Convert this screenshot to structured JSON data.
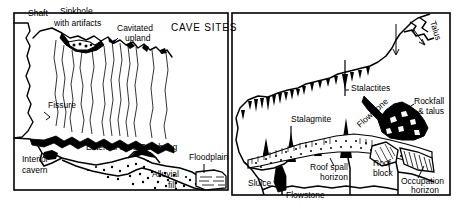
{
  "figure": {
    "title": "CAVE SITES",
    "type": "two-panel geological cross-section line drawing",
    "colors": {
      "ink": "#000000",
      "paper": "#ffffff"
    }
  },
  "panels": [
    {
      "id": "left-panel",
      "name": "karst-landscape-cross-section",
      "heading": "CAVE SITES",
      "labels": [
        {
          "id": "shaft",
          "text": "Shaft",
          "x": 28,
          "y": 16
        },
        {
          "id": "sinkhole",
          "text": "Sinkhole",
          "x": 60,
          "y": 14
        },
        {
          "id": "with-artifacts",
          "text": "with artifacts",
          "x": 54,
          "y": 26
        },
        {
          "id": "cavitated",
          "text": "Cavitated",
          "x": 117,
          "y": 31
        },
        {
          "id": "upland",
          "text": "upland",
          "x": 125,
          "y": 41
        },
        {
          "id": "fissure",
          "text": "Fissure",
          "x": 48,
          "y": 108
        },
        {
          "id": "ext-overhang",
          "text": "External cave Overhang",
          "x": 86,
          "y": 150
        },
        {
          "id": "interior",
          "text": "Interior",
          "x": 22,
          "y": 162
        },
        {
          "id": "cavern",
          "text": "cavern",
          "x": 22,
          "y": 173
        },
        {
          "id": "alluvial",
          "text": "Alluvial",
          "x": 152,
          "y": 177
        },
        {
          "id": "fill",
          "text": "fill",
          "x": 168,
          "y": 188
        },
        {
          "id": "floodplain",
          "text": "Floodplain",
          "x": 189,
          "y": 160
        }
      ]
    },
    {
      "id": "right-panel",
      "name": "cave-interior-cross-section",
      "labels": [
        {
          "id": "talus",
          "text": "Talus",
          "x": 432,
          "y": 28,
          "rotated": true
        },
        {
          "id": "stalactites",
          "text": "Stalactites",
          "x": 351,
          "y": 91
        },
        {
          "id": "stalagmite",
          "text": "Stalagmite",
          "x": 291,
          "y": 122
        },
        {
          "id": "flowstone-upper",
          "text": "Flowstone",
          "x": 372,
          "y": 120,
          "rotated": true
        },
        {
          "id": "rockfall",
          "text": "Rockfall",
          "x": 414,
          "y": 104
        },
        {
          "id": "and-talus",
          "text": "& talus",
          "x": 418,
          "y": 114
        },
        {
          "id": "roof-spall",
          "text": "Roof spall",
          "x": 310,
          "y": 170
        },
        {
          "id": "spall-horizon",
          "text": "horizon",
          "x": 320,
          "y": 180
        },
        {
          "id": "roof-block",
          "text": "Roof",
          "x": 373,
          "y": 166
        },
        {
          "id": "block",
          "text": "block",
          "x": 373,
          "y": 176
        },
        {
          "id": "occupation",
          "text": "Occupation",
          "x": 401,
          "y": 184
        },
        {
          "id": "occ-horizon",
          "text": "horizon",
          "x": 411,
          "y": 193
        },
        {
          "id": "sluice",
          "text": "Sluice",
          "x": 248,
          "y": 186
        },
        {
          "id": "flowstone-lower",
          "text": "Flowstone",
          "x": 286,
          "y": 198
        }
      ]
    }
  ]
}
